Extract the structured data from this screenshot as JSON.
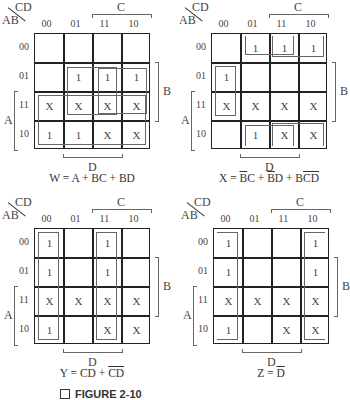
{
  "col_var": "CD",
  "row_var": "AB",
  "col_labels": [
    "00",
    "01",
    "11",
    "10"
  ],
  "row_labels": [
    "00",
    "01",
    "11",
    "10"
  ],
  "side_labels": {
    "top": "C",
    "right": "B",
    "left": "A",
    "bottom": "D"
  },
  "maps": [
    {
      "id": "W",
      "cells": [
        [
          "",
          "",
          "",
          ""
        ],
        [
          "",
          "1",
          "1",
          "1"
        ],
        [
          "X",
          "X",
          "X",
          "X"
        ],
        [
          "1",
          "1",
          "X",
          "X"
        ]
      ],
      "equation": {
        "lhs": "W = ",
        "terms": [
          {
            "t": "A"
          },
          {
            "t": " + "
          },
          {
            "t": "BC"
          },
          {
            "t": " + "
          },
          {
            "t": "BD"
          }
        ]
      },
      "groups": [
        "A",
        "BC",
        "BD"
      ]
    },
    {
      "id": "X",
      "cells": [
        [
          "",
          "1",
          "1",
          "1"
        ],
        [
          "1",
          "",
          "",
          ""
        ],
        [
          "X",
          "X",
          "X",
          "X"
        ],
        [
          "",
          "1",
          "X",
          "X"
        ]
      ],
      "equation": {
        "lhs": "X = ",
        "terms": [
          {
            "t": "B",
            "ov": true
          },
          {
            "t": "C"
          },
          {
            "t": " + "
          },
          {
            "t": "B",
            "ov": true
          },
          {
            "t": "D"
          },
          {
            "t": " + "
          },
          {
            "t": "B"
          },
          {
            "t": "CD",
            "ov": true
          }
        ]
      },
      "groups": [
        "B'C",
        "B'D",
        "BC'D'"
      ]
    },
    {
      "id": "Y",
      "cells": [
        [
          "1",
          "",
          "1",
          ""
        ],
        [
          "1",
          "",
          "1",
          ""
        ],
        [
          "X",
          "X",
          "X",
          "X"
        ],
        [
          "1",
          "",
          "X",
          "X"
        ]
      ],
      "equation": {
        "lhs": "Y = ",
        "terms": [
          {
            "t": "CD"
          },
          {
            "t": " + "
          },
          {
            "t": "CD",
            "ov": true
          }
        ]
      },
      "groups": [
        "CD",
        "C'D'"
      ]
    },
    {
      "id": "Z",
      "cells": [
        [
          "1",
          "",
          "",
          "1"
        ],
        [
          "1",
          "",
          "",
          "1"
        ],
        [
          "X",
          "X",
          "X",
          "X"
        ],
        [
          "1",
          "",
          "X",
          "X"
        ]
      ],
      "equation": {
        "lhs": "Z = ",
        "terms": [
          {
            "t": "D",
            "ov": true
          }
        ]
      },
      "groups": [
        "D'"
      ]
    }
  ],
  "caption": "FIGURE 2-10"
}
